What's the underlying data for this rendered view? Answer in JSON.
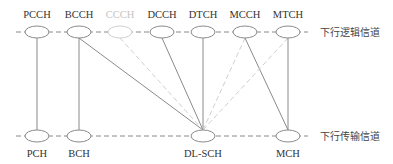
{
  "diagram": {
    "top_row": {
      "label": "下行逻辑信道",
      "y": 32,
      "nodes": [
        {
          "id": "PCCH",
          "label": "PCCH",
          "x": 37,
          "faded": false
        },
        {
          "id": "BCCH",
          "label": "BCCH",
          "x": 79,
          "faded": false
        },
        {
          "id": "CCCH",
          "label": "CCCH",
          "x": 120,
          "faded": true
        },
        {
          "id": "DCCH",
          "label": "DCCH",
          "x": 162,
          "faded": false
        },
        {
          "id": "DTCH",
          "label": "DTCH",
          "x": 203,
          "faded": false
        },
        {
          "id": "MCCH",
          "label": "MCCH",
          "x": 245,
          "faded": false
        },
        {
          "id": "MTCH",
          "label": "MTCH",
          "x": 288,
          "faded": false
        }
      ]
    },
    "bottom_row": {
      "label": "下行传输信道",
      "y": 136,
      "nodes": [
        {
          "id": "PCH",
          "label": "PCH",
          "x": 37
        },
        {
          "id": "BCH",
          "label": "BCH",
          "x": 79
        },
        {
          "id": "DL-SCH",
          "label": "DL-SCH",
          "x": 203
        },
        {
          "id": "MCH",
          "label": "MCH",
          "x": 288
        }
      ]
    },
    "edges": [
      {
        "from": "PCCH",
        "to": "PCH",
        "style": "solid"
      },
      {
        "from": "BCCH",
        "to": "BCH",
        "style": "solid"
      },
      {
        "from": "BCCH",
        "to": "DL-SCH",
        "style": "solid"
      },
      {
        "from": "CCCH",
        "to": "DL-SCH",
        "style": "dashed-faded"
      },
      {
        "from": "DCCH",
        "to": "DL-SCH",
        "style": "solid"
      },
      {
        "from": "DTCH",
        "to": "DL-SCH",
        "style": "solid"
      },
      {
        "from": "MCCH",
        "to": "DL-SCH",
        "style": "dashed-faded"
      },
      {
        "from": "MCCH",
        "to": "MCH",
        "style": "solid"
      },
      {
        "from": "MTCH",
        "to": "DL-SCH",
        "style": "dashed-faded"
      },
      {
        "from": "MTCH",
        "to": "MCH",
        "style": "solid"
      }
    ],
    "colors": {
      "line": "#8a8a8a",
      "faded": "#cfcfcf",
      "text": "#333333"
    }
  }
}
